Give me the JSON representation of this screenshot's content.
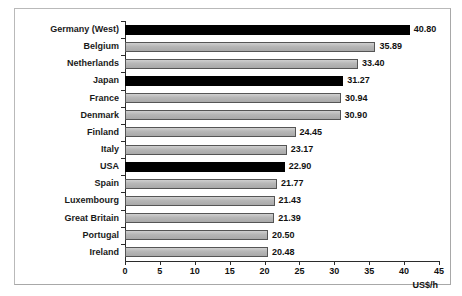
{
  "chart_data": {
    "type": "bar",
    "orientation": "horizontal",
    "title": "",
    "xlabel": "US$/h",
    "ylabel": "",
    "xlim": [
      0,
      45
    ],
    "xticks": [
      0,
      5,
      10,
      15,
      20,
      25,
      30,
      35,
      40,
      45
    ],
    "grid": false,
    "legend": null,
    "categories": [
      "Germany (West)",
      "Belgium",
      "Netherlands",
      "Japan",
      "France",
      "Denmark",
      "Finland",
      "Italy",
      "USA",
      "Spain",
      "Luxembourg",
      "Great Britain",
      "Portugal",
      "Ireland"
    ],
    "values": [
      40.8,
      35.89,
      33.4,
      31.27,
      30.94,
      30.9,
      24.45,
      23.17,
      22.9,
      21.77,
      21.43,
      21.39,
      20.5,
      20.48
    ],
    "value_labels": [
      "40.80",
      "35.89",
      "33.40",
      "31.27",
      "30.94",
      "30.90",
      "24.45",
      "23.17",
      "22.90",
      "21.77",
      "21.43",
      "21.39",
      "20.50",
      "20.48"
    ],
    "bar_styles": [
      "black",
      "gray",
      "gray",
      "black",
      "gray",
      "gray",
      "gray",
      "gray",
      "black",
      "gray",
      "gray",
      "gray",
      "gray",
      "gray"
    ],
    "colors": {
      "highlight": "#000000",
      "default": "#b6b6b6",
      "bar_border": "#555555",
      "axis": "#2b2b2b",
      "frame": "#b9b9b9",
      "background": "#ffffff",
      "text": "#111111"
    }
  }
}
